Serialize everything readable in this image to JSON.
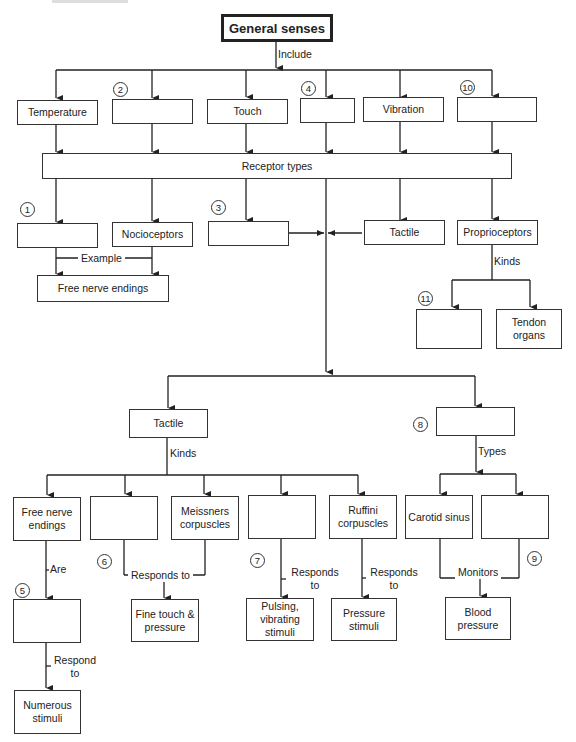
{
  "diagram": {
    "title": "General senses",
    "include_label": "Include",
    "senses": [
      "Temperature",
      "",
      "Touch",
      "",
      "Vibration",
      ""
    ],
    "receptor_types": "Receptor types",
    "receptors": [
      "",
      "Nocioceptors",
      "",
      "Tactile",
      "Proprioceptors"
    ],
    "example_label": "Example",
    "free_nerve_endings": "Free nerve endings",
    "kinds_label": "Kinds",
    "proprio_kinds": [
      "",
      "Tendon organs"
    ],
    "tactile": "Tactile",
    "baro": "",
    "types_label": "Types",
    "tactile_kinds": [
      "Free nerve endings",
      "",
      "Meissners corpuscles",
      "",
      "Ruffini corpuscles"
    ],
    "baro_types": [
      "Carotid sinus",
      ""
    ],
    "are_label": "Are",
    "responds_to": "Responds to",
    "responds_to_2": "Responds to",
    "responds_to_3": "Responds to",
    "monitors_label": "Monitors",
    "respond_to_label": "Respond to",
    "blank5": "",
    "fine_touch": "Fine touch & pressure",
    "pulsing": "Pulsing, vibrating stimuli",
    "pressure_stimuli": "Pressure stimuli",
    "blood_pressure": "Blood pressure",
    "numerous_stimuli": "Numerous stimuli",
    "numbers": [
      "1",
      "2",
      "3",
      "4",
      "5",
      "6",
      "7",
      "8",
      "9",
      "10",
      "11"
    ]
  }
}
